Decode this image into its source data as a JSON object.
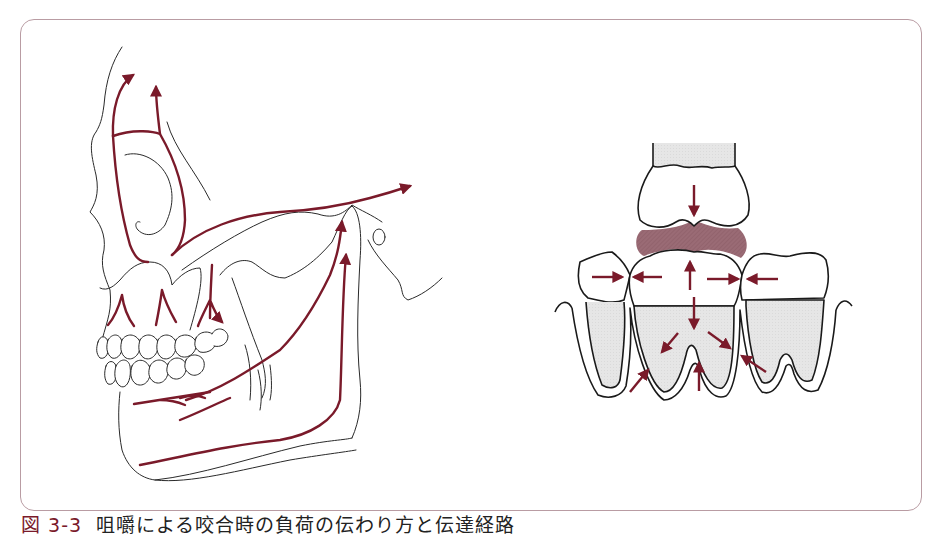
{
  "figure": {
    "caption_number": "図 3-3",
    "caption_text": "咀嚼による咬合時の負荷の伝わり方と伝達経路",
    "panels": [
      {
        "id": "skull",
        "description": "Lateral skull view with force transmission pathways from teeth through maxilla, zygomatic arch and mandible"
      },
      {
        "id": "teeth",
        "description": "Occlusion of upper and lower molars with food bolus and arrows showing force distribution to roots and adjacent teeth"
      }
    ]
  },
  "colors": {
    "force_arrow": "#7a1a2a",
    "food_bolus": "#9a6b75",
    "root_fill": "#e4e4e4",
    "frame_border": "#b99ca3",
    "outline": "#1a1a1a"
  }
}
